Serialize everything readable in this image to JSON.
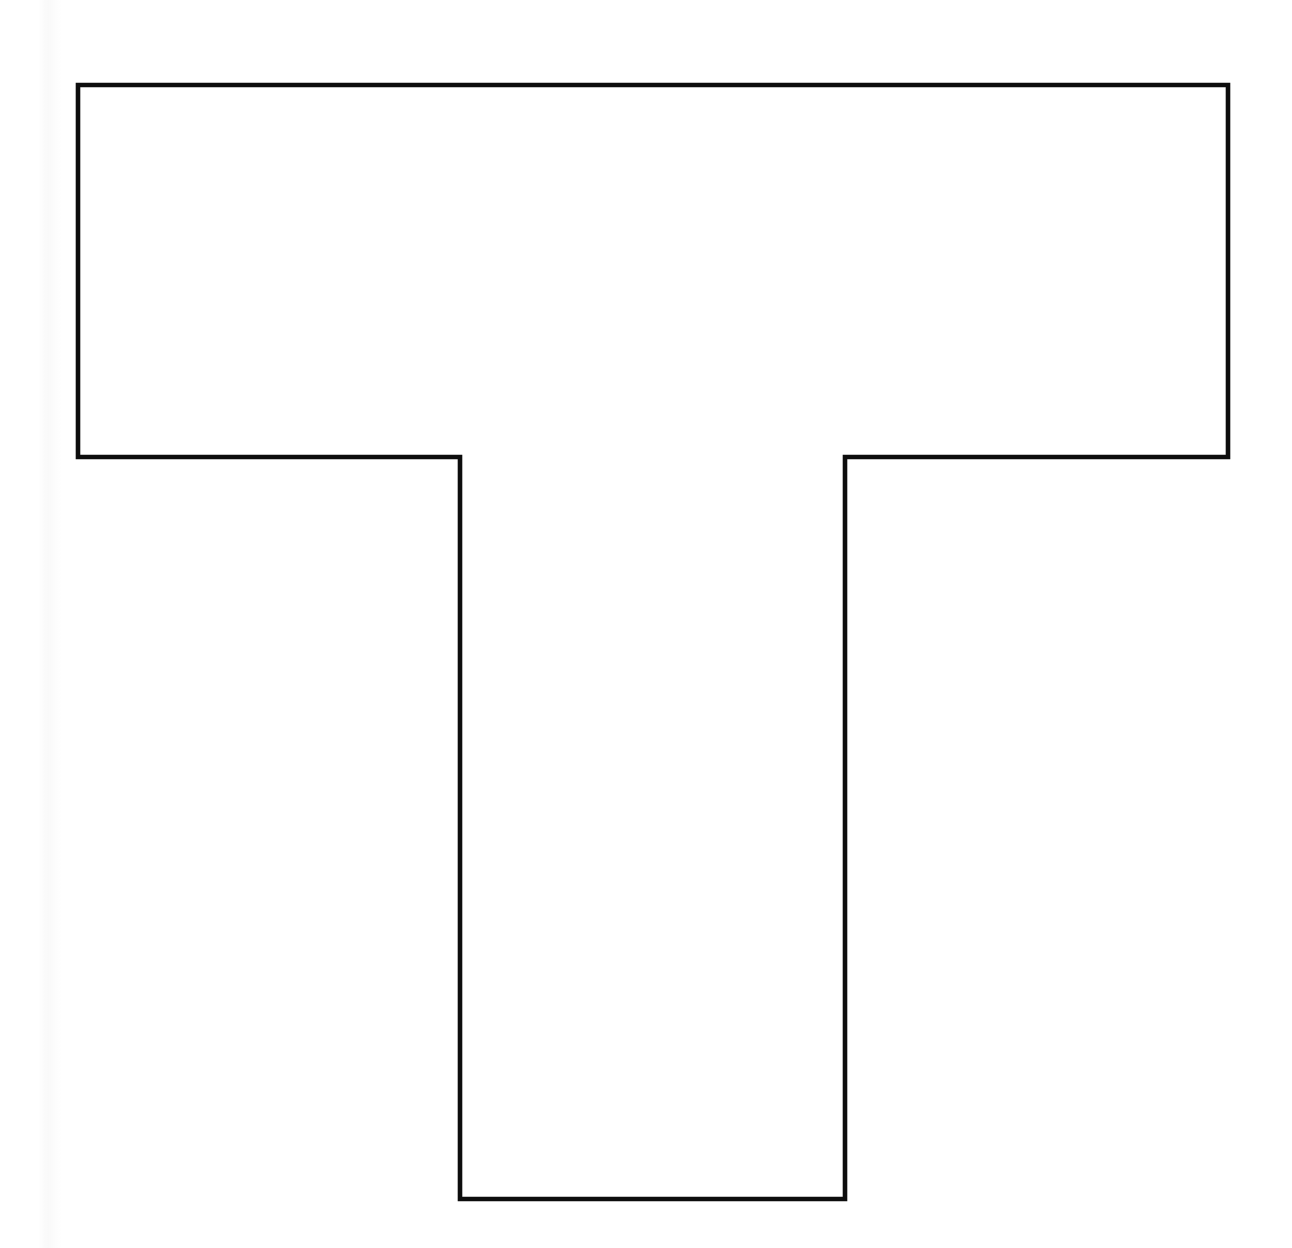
{
  "document": {
    "kind": "line-drawing",
    "background_color": "#ffffff",
    "width": 1292,
    "height": 1248
  },
  "figure": {
    "name": "t-shape-outline",
    "stroke_color": "#0d0d0d",
    "fill_color": "#ffffff",
    "stroke_width": 4.6,
    "vertices": [
      [
        78,
        85
      ],
      [
        1228,
        85
      ],
      [
        1228,
        457
      ],
      [
        845,
        457
      ],
      [
        845,
        1199
      ],
      [
        460,
        1199
      ],
      [
        460,
        457
      ],
      [
        78,
        457
      ]
    ],
    "path": "M 78 85 L 1228 85 L 1228 457 L 845 457 L 845 1199 L 460 1199 L 460 457 L 78 457 Z",
    "measurements": {
      "top_bar_width": 1150,
      "top_bar_height": 372,
      "stem_width": 385,
      "stem_height": 742,
      "total_width": 1150,
      "total_height": 1114
    }
  },
  "labels": {
    "title": "",
    "annotations": []
  }
}
